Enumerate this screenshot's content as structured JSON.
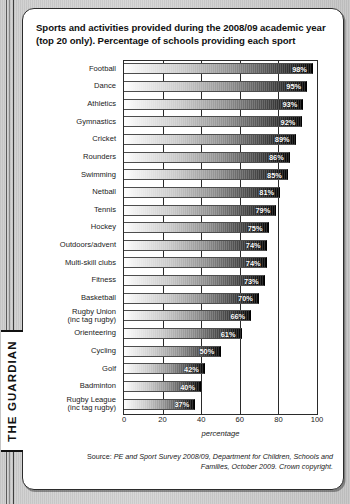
{
  "publication": {
    "nameplate": "THE GUARDIAN"
  },
  "chart_data": {
    "type": "bar",
    "orientation": "horizontal",
    "title": "Sports and activities provided during the 2008/09 academic year (top 20 only). Percentage of schools providing each sport",
    "xlabel": "percentage",
    "ylabel": "",
    "xlim": [
      0,
      100
    ],
    "xticks": [
      0,
      20,
      40,
      60,
      80,
      100
    ],
    "grid": true,
    "legend": null,
    "value_suffix": "%",
    "categories": [
      "Football",
      "Dance",
      "Athletics",
      "Gymnastics",
      "Cricket",
      "Rounders",
      "Swimming",
      "Netball",
      "Tennis",
      "Hockey",
      "Outdoors/advent",
      "Multi-skill clubs",
      "Fitness",
      "Basketball",
      "Rugby Union\n(inc tag rugby)",
      "Orienteering",
      "Cycling",
      "Golf",
      "Badminton",
      "Rugby League\n(inc tag rugby)"
    ],
    "values": [
      98,
      95,
      93,
      92,
      89,
      86,
      85,
      81,
      79,
      75,
      74,
      74,
      73,
      70,
      66,
      61,
      50,
      42,
      40,
      37
    ],
    "value_labels": [
      "98%",
      "95%",
      "93%",
      "92%",
      "89%",
      "86%",
      "85%",
      "81%",
      "79%",
      "75%",
      "74%",
      "74%",
      "73%",
      "70%",
      "66%",
      "61%",
      "50%",
      "42%",
      "40%",
      "37%"
    ],
    "xtick_labels": [
      "0",
      "20",
      "40",
      "60",
      "80",
      "100"
    ]
  },
  "source": {
    "label": "Source:",
    "text": " PE and Sport Survey 2008/09, Department for Children, Schools and Families, October 2009. Crown copyright."
  },
  "colors": {
    "panel_background": "#ffffff",
    "page_background": "#cfcfcf",
    "bar_gradient_start": "#ffffff",
    "bar_gradient_end": "#050505",
    "text": "#1a1a1a",
    "axis": "#2a2a2a"
  }
}
